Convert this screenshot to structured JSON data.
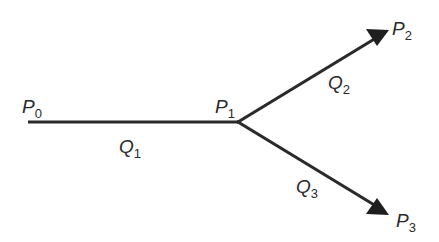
{
  "diagram": {
    "type": "flow-branch",
    "colors": {
      "stroke": "#2a2a2a",
      "background": "#ffffff"
    },
    "nodes": [
      {
        "id": "P0",
        "letter": "P",
        "sub": "0",
        "x": 28,
        "y": 122
      },
      {
        "id": "P1",
        "letter": "P",
        "sub": "1",
        "x": 238,
        "y": 122
      },
      {
        "id": "P2",
        "letter": "P",
        "sub": "2",
        "x": 388,
        "y": 30
      },
      {
        "id": "P3",
        "letter": "P",
        "sub": "3",
        "x": 388,
        "y": 215
      }
    ],
    "edges": [
      {
        "id": "Q1",
        "letter": "Q",
        "sub": "1",
        "from": "P0",
        "to": "P1",
        "arrow": false
      },
      {
        "id": "Q2",
        "letter": "Q",
        "sub": "2",
        "from": "P1",
        "to": "P2",
        "arrow": true
      },
      {
        "id": "Q3",
        "letter": "Q",
        "sub": "3",
        "from": "P1",
        "to": "P3",
        "arrow": true
      }
    ],
    "labels": {
      "P0": {
        "letter": "P",
        "sub": "0"
      },
      "P1": {
        "letter": "P",
        "sub": "1"
      },
      "P2": {
        "letter": "P",
        "sub": "2"
      },
      "P3": {
        "letter": "P",
        "sub": "3"
      },
      "Q1": {
        "letter": "Q",
        "sub": "1"
      },
      "Q2": {
        "letter": "Q",
        "sub": "2"
      },
      "Q3": {
        "letter": "Q",
        "sub": "3"
      }
    }
  }
}
